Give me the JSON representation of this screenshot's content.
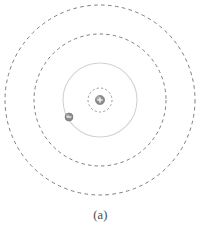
{
  "figure": {
    "caption": "(a)",
    "background_color": "#ffffff"
  },
  "chart_data": {
    "type": "scatter",
    "title": "",
    "subtitle": "",
    "xlabel": "",
    "ylabel": "",
    "grid": false,
    "legend": null,
    "center": {
      "x": 100,
      "y": 100
    },
    "nucleus": {
      "label": "+",
      "radius": 4.6,
      "fill_color": "#8c8c8c",
      "edge_color": "#6e6e6e",
      "highlight_color": "#b9b9b9"
    },
    "electron": {
      "label": "–",
      "radius": 4.0,
      "x": 69,
      "y": 117,
      "angle_deg": 220,
      "on_orbit": 1,
      "fill_color": "#8c8c8c",
      "edge_color": "#6e6e6e",
      "highlight_color": "#bdbdbd"
    },
    "orbits": [
      {
        "name": "nucleus-shell",
        "radius": 12,
        "style": "dashed",
        "color": "#8e8e8e",
        "stroke_width": 0.9,
        "dash": "2.2 2.2",
        "occupied": false
      },
      {
        "name": "orbit-n1",
        "radius": 37,
        "style": "solid",
        "color": "#d2d2d2",
        "stroke_width": 1.1,
        "dash": "none",
        "occupied": true
      },
      {
        "name": "orbit-n2",
        "radius": 66,
        "style": "dashed",
        "color": "#7d7d7d",
        "stroke_width": 1.0,
        "dash": "3.4 3.2",
        "occupied": false
      },
      {
        "name": "orbit-n3",
        "radius": 95,
        "style": "dashed",
        "color": "#7d7d7d",
        "stroke_width": 1.0,
        "dash": "3.6 3.4",
        "occupied": false
      }
    ],
    "axis_ranges": {
      "x": [
        0,
        201
      ],
      "y": [
        0,
        201
      ]
    }
  }
}
